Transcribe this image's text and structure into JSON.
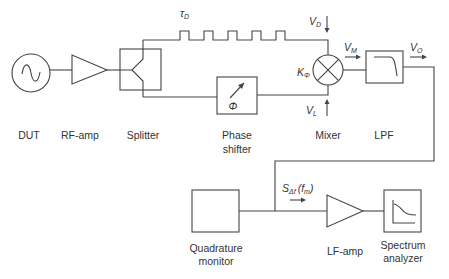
{
  "diagram": {
    "blocks": {
      "dut": {
        "label": "DUT",
        "icon": "sine-source-icon"
      },
      "rf_amp": {
        "label": "RF-amp",
        "icon": "amplifier-triangle-icon"
      },
      "splitter": {
        "label": "Splitter",
        "icon": "splitter-icon"
      },
      "phase_shifter": {
        "label_line1": "Phase",
        "label_line2": "shifter",
        "symbol": "Φ",
        "icon": "variable-arrow-icon"
      },
      "mixer": {
        "label": "Mixer",
        "icon": "mixer-cross-icon"
      },
      "lpf": {
        "label": "LPF",
        "icon": "lowpass-curve-icon"
      },
      "quadrature_monitor": {
        "label_line1": "Quadrature",
        "label_line2": "monitor"
      },
      "lf_amp": {
        "label": "LF-amp",
        "icon": "amplifier-triangle-icon"
      },
      "spectrum_analyzer": {
        "label_line1": "Spectrum",
        "label_line2": "analyzer",
        "icon": "spectrum-plot-icon"
      }
    },
    "annotations": {
      "delay": {
        "main": "τ",
        "sub": "D"
      },
      "vd": {
        "main": "V",
        "sub": "D"
      },
      "vl": {
        "main": "V",
        "sub": "L"
      },
      "vm": {
        "main": "V",
        "sub": "M"
      },
      "vo": {
        "main": "V",
        "sub": "O"
      },
      "kphi": {
        "main": "K",
        "sub": "Φ"
      },
      "signal": {
        "main": "S",
        "sub": "Δf",
        "arg": "(f",
        "arg_sub": "m",
        "arg_close": ")"
      }
    },
    "colors": {
      "line": "#444444",
      "text": "#333333",
      "background": "#ffffff"
    }
  }
}
